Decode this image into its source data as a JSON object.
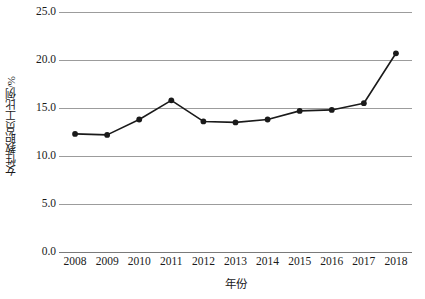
{
  "chart_data": {
    "type": "line",
    "title": "",
    "xlabel": "年份",
    "ylabel": "女性教职员工比例/%",
    "categories": [
      "2008",
      "2009",
      "2010",
      "2011",
      "2012",
      "2013",
      "2014",
      "2015",
      "2016",
      "2017",
      "2018"
    ],
    "x": [
      2008,
      2009,
      2010,
      2011,
      2012,
      2013,
      2014,
      2015,
      2016,
      2017,
      2018
    ],
    "values": [
      12.3,
      12.2,
      13.8,
      15.8,
      13.6,
      13.5,
      13.8,
      14.7,
      14.8,
      15.5,
      20.7
    ],
    "series": [
      {
        "name": "女性教职员工比例",
        "values": [
          12.3,
          12.2,
          13.8,
          15.8,
          13.6,
          13.5,
          13.8,
          14.7,
          14.8,
          15.5,
          20.7
        ]
      }
    ],
    "ylim": [
      0.0,
      25.0
    ],
    "ytick_labels": [
      "0.0",
      "5.0",
      "10.0",
      "15.0",
      "20.0",
      "25.0"
    ],
    "yticks": [
      0.0,
      5.0,
      10.0,
      15.0,
      20.0,
      25.0
    ],
    "grid": true,
    "legend": false,
    "legend_position": "none",
    "line_color": "#1a1a1a",
    "marker_color": "#1a1a1a",
    "marker_shape": "circle",
    "gridline_color": "#9c9c9c",
    "background_color": "#ffffff"
  }
}
